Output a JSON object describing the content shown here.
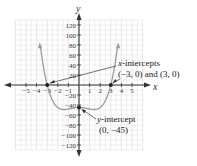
{
  "chart_data": {
    "type": "line",
    "title": "",
    "function": "f(x) = x^4 - 4x^2 - 45",
    "xlabel": "x",
    "ylabel": "y",
    "xlim": [
      -6,
      6
    ],
    "ylim": [
      -130,
      130
    ],
    "x_ticks": [
      -5,
      -4,
      -3,
      -2,
      -1,
      1,
      2,
      3,
      4,
      5
    ],
    "x_tick_labels": [
      "−5",
      "−4",
      "−3",
      "−2",
      "−1",
      "1",
      "2",
      "3",
      "4",
      "5"
    ],
    "y_ticks": [
      120,
      100,
      80,
      60,
      40,
      20,
      -20,
      -40,
      -60,
      -80,
      -100,
      -120
    ],
    "y_tick_labels": [
      "120",
      "100",
      "80",
      "60",
      "40",
      "20",
      "−20",
      "−40",
      "−60",
      "−80",
      "−100",
      "−120"
    ],
    "grid": true,
    "series": [
      {
        "name": "f(x)",
        "color": "#9a9a9a",
        "x": [
          -3.64,
          -3.5,
          -3.25,
          -3,
          -2.75,
          -2.5,
          -2.25,
          -2,
          -1.75,
          -1.5,
          -1.41,
          -1.25,
          -1,
          -0.75,
          -0.5,
          -0.25,
          0,
          0.25,
          0.5,
          0.75,
          1,
          1.25,
          1.41,
          1.5,
          1.75,
          2,
          2.25,
          2.5,
          2.75,
          3,
          3.25,
          3.5,
          3.64
        ],
        "y": [
          83,
          56.1,
          24.3,
          0,
          -18.0,
          -31.9,
          -39.6,
          -45,
          -48.6,
          -49.9,
          -49,
          -49.8,
          -48,
          -46.9,
          -45.9,
          -45.2,
          -45,
          -45.2,
          -45.9,
          -46.9,
          -48,
          -49.8,
          -49,
          -49.9,
          -48.6,
          -45,
          -39.6,
          -31.9,
          -18.0,
          0,
          24.3,
          56.1,
          83
        ]
      }
    ],
    "key_points": [
      {
        "label": "x-intercept",
        "x": -3,
        "y": 0
      },
      {
        "label": "x-intercept",
        "x": 3,
        "y": 0
      },
      {
        "label": "y-intercept",
        "x": 0,
        "y": -45
      }
    ],
    "annotations": [
      {
        "text_line1": "x-intercepts",
        "text_line2": "(−3, 0) and (3, 0)"
      },
      {
        "text_line1": "y-intercept",
        "text_line2": "(0, −45)"
      }
    ]
  },
  "labels": {
    "x_axis": "x",
    "y_axis": "y",
    "x_intercepts_title_var": "x",
    "x_intercepts_title_rest": "-intercepts",
    "x_intercepts_values": "(−3, 0) and (3, 0)",
    "y_intercept_title_var": "y",
    "y_intercept_title_rest": "-intercept",
    "y_intercept_value": "(0, −45)"
  },
  "colors": {
    "curve": "#9a9a9a",
    "axis": "#333333",
    "grid": "#dcdcdc",
    "point": "#222222"
  }
}
